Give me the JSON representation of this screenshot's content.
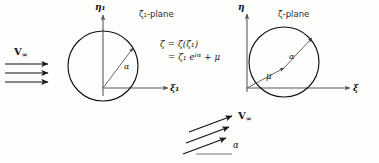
{
  "figure": {
    "background_color": "#fdfdfc",
    "ink_color": "#1a1a1a"
  },
  "left_panel": {
    "plane_label": "ζ₁-plane",
    "vertical_axis_label": "η₁",
    "horizontal_axis_label": "ξ₁",
    "angle_label": "α",
    "circle": {
      "cx": 103,
      "cy": 66,
      "r": 35
    }
  },
  "right_panel": {
    "plane_label": "ζ-plane",
    "vertical_axis_label": "η",
    "horizontal_axis_label": "ξ",
    "angle_label": "α",
    "offset_label": "μ",
    "circle": {
      "cx": 284,
      "cy": 62,
      "r": 35
    }
  },
  "equation": {
    "line1_lhs": "ζ",
    "line1_eq": "=",
    "line1_rhs": "ζ(ζ₁)",
    "line2_eq": "=",
    "line2_rhs_base": "ζ₁ e",
    "line2_rhs_exp": "iα",
    "line2_rhs_tail": "+ μ",
    "full_text": "ζ = ζ(ζ₁) = ζ₁ e^{iα} + μ"
  },
  "freestream_left": {
    "label": "V",
    "label_sub": "∞",
    "arrow_count": 3,
    "direction": "horizontal"
  },
  "freestream_bottom": {
    "label": "V",
    "label_sub": "∞",
    "angle_label": "α",
    "arrow_count": 3,
    "direction": "inclined"
  }
}
